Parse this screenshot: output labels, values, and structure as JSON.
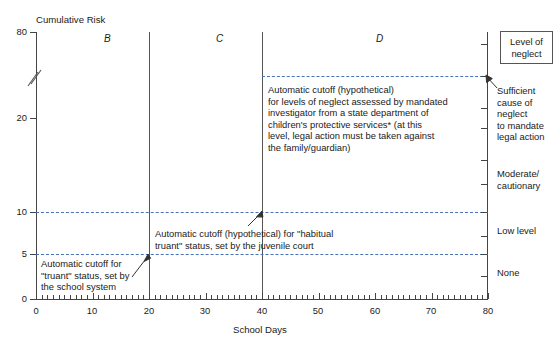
{
  "chart_data": {
    "type": "line",
    "title": "",
    "ylabel": "Cumulative Risk",
    "xlabel": "School Days",
    "xlim": [
      0,
      80
    ],
    "ylim": [
      0,
      80
    ],
    "grid": false,
    "axis_break": true,
    "axis_break_note": "y-axis broken between 20 and 80",
    "x_ticks": [
      0,
      10,
      20,
      30,
      40,
      50,
      60,
      70,
      80
    ],
    "x_tick_labels": [
      "0",
      "10",
      "20",
      "30",
      "40",
      "50",
      "60",
      "70",
      "80"
    ],
    "x_minor_tick_interval": 1,
    "y_ticks": [
      0,
      5,
      10,
      20,
      80
    ],
    "y_tick_labels": [
      "0",
      "5",
      "10",
      "20",
      "80"
    ],
    "series": [],
    "threshold_lines": [
      {
        "name": "truant-cutoff",
        "y_value": 5,
        "style": "dashed",
        "color": "#4a72b8",
        "label": "Automatic cutoff for\n\"truant\" status, set by\nthe school system"
      },
      {
        "name": "habitual-truant-cutoff",
        "y_value": 10,
        "style": "dashed",
        "color": "#4a72b8",
        "label": "Automatic cutoff (hypothetical) for \"habitual\ntruant\" status, set by the juvenile court"
      },
      {
        "name": "neglect-cutoff",
        "y_value": 40,
        "style": "dashed",
        "color": "#4a72b8",
        "label": "Automatic cutoff (hypothetical)\nfor levels of neglect assessed by mandated\ninvestigator from a state department of\nchildren's protective services* (at this\nlevel, legal action must be taken against\nthe family/guardian)"
      }
    ],
    "region_dividers": [
      20,
      40
    ],
    "region_labels": [
      {
        "label": "B",
        "x_center": 10
      },
      {
        "label": "C",
        "x_center": 30
      },
      {
        "label": "D",
        "x_center": 60
      }
    ],
    "right_axis": {
      "title": "Level of neglect",
      "categories": [
        "Sufficient\ncause of\nneglect\nto mandate\nlegal action",
        "Moderate/\ncautionary",
        "Low level",
        "None"
      ]
    }
  },
  "axes": {
    "y_axis_title": "Cumulative Risk",
    "x_axis_title": "School Days",
    "y_tick_labels": [
      "80",
      "20",
      "10",
      "5",
      "0"
    ],
    "x_tick_labels": [
      "0",
      "10",
      "20",
      "30",
      "40",
      "50",
      "60",
      "70",
      "80"
    ]
  },
  "regions": {
    "b_label": "B",
    "c_label": "C",
    "d_label": "D"
  },
  "legend": {
    "line1": "Level of",
    "line2": "neglect"
  },
  "right_categories": {
    "sufficient_l1": "Sufficient",
    "sufficient_l2": "cause of",
    "sufficient_l3": "neglect",
    "sufficient_l4": "to mandate",
    "sufficient_l5": "legal action",
    "moderate_l1": "Moderate/",
    "moderate_l2": "cautionary",
    "low": "Low level",
    "none": "None"
  },
  "annotations": {
    "neglect_cutoff": "Automatic cutoff (hypothetical)\nfor levels of neglect assessed by mandated\ninvestigator from a state department of\nchildren's protective services* (at this\nlevel, legal action must be taken against\nthe family/guardian)",
    "habitual_truant": "Automatic cutoff (hypothetical) for \"habitual\ntruant\" status, set by the juvenile court",
    "truant": "Automatic cutoff for\n\"truant\" status, set by\nthe school system"
  }
}
